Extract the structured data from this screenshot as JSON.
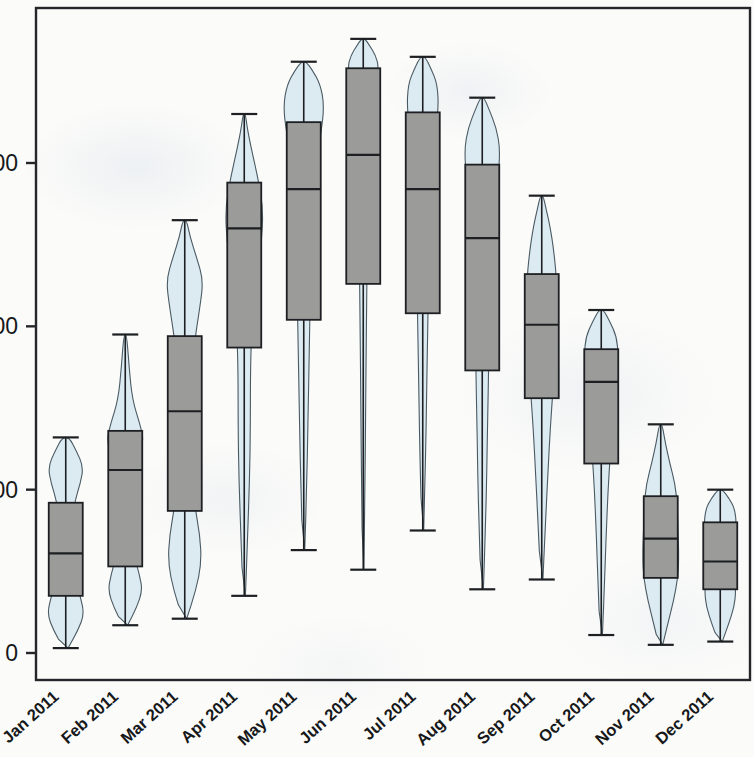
{
  "chart_data": {
    "type": "box",
    "title": "",
    "xlabel": "",
    "ylabel": "",
    "categories": [
      "Jan 2011",
      "Feb 2011",
      "Mar 2011",
      "Apr 2011",
      "May 2011",
      "Jun 2011",
      "Jul 2011",
      "Aug 2011",
      "Sep 2011",
      "Oct 2011",
      "Nov 2011",
      "Dec 2011"
    ],
    "ytick_labels": [
      "0",
      "100",
      "200",
      "300"
    ],
    "ytick_values": [
      0,
      100,
      200,
      300
    ],
    "ylim": [
      -8,
      413
    ],
    "xlim": [
      0,
      13
    ],
    "grid": false,
    "legend": false,
    "marks": "violin-plot with overlaid box-and-whisker (grey boxes, pale blue density curves)",
    "colors": {
      "violin_fill": "#dceaf1",
      "violin_stroke": "#4a5a63",
      "box_fill": "#9b9b99",
      "box_stroke": "#1d1f22",
      "axis": "#24262a",
      "background": "#fbfbf9"
    },
    "series": [
      {
        "name": "Jan 2011",
        "whisker_low": 3,
        "q1": 35,
        "median": 61,
        "q3": 92,
        "whisker_high": 132,
        "density": [
          {
            "v": 3,
            "w": 0.1
          },
          {
            "v": 14,
            "w": 0.52
          },
          {
            "v": 24,
            "w": 0.78
          },
          {
            "v": 35,
            "w": 0.6
          },
          {
            "v": 50,
            "w": 0.34
          },
          {
            "v": 62,
            "w": 0.26
          },
          {
            "v": 78,
            "w": 0.3
          },
          {
            "v": 92,
            "w": 0.36
          },
          {
            "v": 104,
            "w": 0.62
          },
          {
            "v": 114,
            "w": 0.74
          },
          {
            "v": 124,
            "w": 0.44
          },
          {
            "v": 132,
            "w": 0.14
          }
        ]
      },
      {
        "name": "Feb 2011",
        "whisker_low": 17,
        "q1": 53,
        "median": 112,
        "q3": 136,
        "whisker_high": 195,
        "density": [
          {
            "v": 17,
            "w": 0.1
          },
          {
            "v": 28,
            "w": 0.48
          },
          {
            "v": 38,
            "w": 0.72
          },
          {
            "v": 48,
            "w": 0.6
          },
          {
            "v": 60,
            "w": 0.36
          },
          {
            "v": 80,
            "w": 0.24
          },
          {
            "v": 100,
            "w": 0.26
          },
          {
            "v": 118,
            "w": 0.52
          },
          {
            "v": 130,
            "w": 0.78
          },
          {
            "v": 140,
            "w": 0.62
          },
          {
            "v": 155,
            "w": 0.3
          },
          {
            "v": 175,
            "w": 0.16
          },
          {
            "v": 195,
            "w": 0.06
          }
        ]
      },
      {
        "name": "Mar 2011",
        "whisker_low": 21,
        "q1": 87,
        "median": 148,
        "q3": 194,
        "whisker_high": 265,
        "density": [
          {
            "v": 21,
            "w": 0.08
          },
          {
            "v": 38,
            "w": 0.46
          },
          {
            "v": 55,
            "w": 0.7
          },
          {
            "v": 72,
            "w": 0.64
          },
          {
            "v": 92,
            "w": 0.4
          },
          {
            "v": 115,
            "w": 0.26
          },
          {
            "v": 140,
            "w": 0.22
          },
          {
            "v": 165,
            "w": 0.26
          },
          {
            "v": 188,
            "w": 0.38
          },
          {
            "v": 212,
            "w": 0.64
          },
          {
            "v": 228,
            "w": 0.78
          },
          {
            "v": 242,
            "w": 0.5
          },
          {
            "v": 255,
            "w": 0.22
          },
          {
            "v": 265,
            "w": 0.08
          }
        ]
      },
      {
        "name": "Apr 2011",
        "whisker_low": 35,
        "q1": 187,
        "median": 260,
        "q3": 288,
        "whisker_high": 330,
        "density": [
          {
            "v": 35,
            "w": 0.05
          },
          {
            "v": 70,
            "w": 0.14
          },
          {
            "v": 105,
            "w": 0.22
          },
          {
            "v": 140,
            "w": 0.26
          },
          {
            "v": 170,
            "w": 0.26
          },
          {
            "v": 195,
            "w": 0.3
          },
          {
            "v": 225,
            "w": 0.46
          },
          {
            "v": 250,
            "w": 0.72
          },
          {
            "v": 272,
            "w": 0.8
          },
          {
            "v": 292,
            "w": 0.56
          },
          {
            "v": 310,
            "w": 0.28
          },
          {
            "v": 322,
            "w": 0.12
          },
          {
            "v": 330,
            "w": 0.05
          }
        ]
      },
      {
        "name": "May 2011",
        "whisker_low": 63,
        "q1": 204,
        "median": 284,
        "q3": 325,
        "whisker_high": 362,
        "density": [
          {
            "v": 63,
            "w": 0.04
          },
          {
            "v": 100,
            "w": 0.12
          },
          {
            "v": 140,
            "w": 0.18
          },
          {
            "v": 178,
            "w": 0.22
          },
          {
            "v": 208,
            "w": 0.26
          },
          {
            "v": 240,
            "w": 0.3
          },
          {
            "v": 268,
            "w": 0.34
          },
          {
            "v": 295,
            "w": 0.44
          },
          {
            "v": 318,
            "w": 0.72
          },
          {
            "v": 335,
            "w": 0.86
          },
          {
            "v": 348,
            "w": 0.7
          },
          {
            "v": 357,
            "w": 0.36
          },
          {
            "v": 362,
            "w": 0.1
          }
        ]
      },
      {
        "name": "Jun 2011",
        "whisker_low": 51,
        "q1": 226,
        "median": 305,
        "q3": 358,
        "whisker_high": 376,
        "density": [
          {
            "v": 51,
            "w": 0.03
          },
          {
            "v": 100,
            "w": 0.07
          },
          {
            "v": 150,
            "w": 0.1
          },
          {
            "v": 200,
            "w": 0.13
          },
          {
            "v": 245,
            "w": 0.17
          },
          {
            "v": 285,
            "w": 0.2
          },
          {
            "v": 320,
            "w": 0.24
          },
          {
            "v": 345,
            "w": 0.42
          },
          {
            "v": 358,
            "w": 0.66
          },
          {
            "v": 366,
            "w": 0.52
          },
          {
            "v": 372,
            "w": 0.26
          },
          {
            "v": 376,
            "w": 0.08
          }
        ]
      },
      {
        "name": "Jul 2011",
        "whisker_low": 75,
        "q1": 208,
        "median": 284,
        "q3": 331,
        "whisker_high": 365,
        "density": [
          {
            "v": 75,
            "w": 0.04
          },
          {
            "v": 115,
            "w": 0.11
          },
          {
            "v": 155,
            "w": 0.16
          },
          {
            "v": 190,
            "w": 0.2
          },
          {
            "v": 220,
            "w": 0.23
          },
          {
            "v": 252,
            "w": 0.26
          },
          {
            "v": 282,
            "w": 0.3
          },
          {
            "v": 310,
            "w": 0.42
          },
          {
            "v": 332,
            "w": 0.66
          },
          {
            "v": 348,
            "w": 0.62
          },
          {
            "v": 358,
            "w": 0.34
          },
          {
            "v": 365,
            "w": 0.1
          }
        ]
      },
      {
        "name": "Aug 2011",
        "whisker_low": 39,
        "q1": 173,
        "median": 254,
        "q3": 299,
        "whisker_high": 340,
        "density": [
          {
            "v": 39,
            "w": 0.05
          },
          {
            "v": 75,
            "w": 0.13
          },
          {
            "v": 110,
            "w": 0.19
          },
          {
            "v": 145,
            "w": 0.23
          },
          {
            "v": 175,
            "w": 0.27
          },
          {
            "v": 205,
            "w": 0.3
          },
          {
            "v": 235,
            "w": 0.34
          },
          {
            "v": 262,
            "w": 0.42
          },
          {
            "v": 288,
            "w": 0.64
          },
          {
            "v": 308,
            "w": 0.76
          },
          {
            "v": 322,
            "w": 0.58
          },
          {
            "v": 333,
            "w": 0.28
          },
          {
            "v": 340,
            "w": 0.08
          }
        ]
      },
      {
        "name": "Sep 2011",
        "whisker_low": 45,
        "q1": 156,
        "median": 201,
        "q3": 232,
        "whisker_high": 280,
        "density": [
          {
            "v": 45,
            "w": 0.05
          },
          {
            "v": 80,
            "w": 0.16
          },
          {
            "v": 110,
            "w": 0.26
          },
          {
            "v": 138,
            "w": 0.36
          },
          {
            "v": 162,
            "w": 0.48
          },
          {
            "v": 185,
            "w": 0.56
          },
          {
            "v": 205,
            "w": 0.62
          },
          {
            "v": 225,
            "w": 0.64
          },
          {
            "v": 245,
            "w": 0.52
          },
          {
            "v": 262,
            "w": 0.34
          },
          {
            "v": 272,
            "w": 0.18
          },
          {
            "v": 280,
            "w": 0.06
          }
        ]
      },
      {
        "name": "Oct 2011",
        "whisker_low": 11,
        "q1": 116,
        "median": 166,
        "q3": 186,
        "whisker_high": 210,
        "density": [
          {
            "v": 11,
            "w": 0.05
          },
          {
            "v": 40,
            "w": 0.13
          },
          {
            "v": 70,
            "w": 0.2
          },
          {
            "v": 98,
            "w": 0.28
          },
          {
            "v": 122,
            "w": 0.38
          },
          {
            "v": 145,
            "w": 0.5
          },
          {
            "v": 166,
            "w": 0.62
          },
          {
            "v": 182,
            "w": 0.72
          },
          {
            "v": 194,
            "w": 0.64
          },
          {
            "v": 203,
            "w": 0.36
          },
          {
            "v": 210,
            "w": 0.1
          }
        ]
      },
      {
        "name": "Nov 2011",
        "whisker_low": 5,
        "q1": 46,
        "median": 70,
        "q3": 96,
        "whisker_high": 140,
        "density": [
          {
            "v": 5,
            "w": 0.08
          },
          {
            "v": 18,
            "w": 0.3
          },
          {
            "v": 32,
            "w": 0.54
          },
          {
            "v": 46,
            "w": 0.72
          },
          {
            "v": 60,
            "w": 0.76
          },
          {
            "v": 75,
            "w": 0.72
          },
          {
            "v": 90,
            "w": 0.7
          },
          {
            "v": 104,
            "w": 0.6
          },
          {
            "v": 116,
            "w": 0.38
          },
          {
            "v": 128,
            "w": 0.2
          },
          {
            "v": 140,
            "w": 0.06
          }
        ]
      },
      {
        "name": "Dec 2011",
        "whisker_low": 7,
        "q1": 39,
        "median": 56,
        "q3": 80,
        "whisker_high": 100,
        "density": [
          {
            "v": 7,
            "w": 0.08
          },
          {
            "v": 18,
            "w": 0.36
          },
          {
            "v": 28,
            "w": 0.58
          },
          {
            "v": 38,
            "w": 0.66
          },
          {
            "v": 48,
            "w": 0.56
          },
          {
            "v": 58,
            "w": 0.5
          },
          {
            "v": 68,
            "w": 0.54
          },
          {
            "v": 78,
            "w": 0.68
          },
          {
            "v": 88,
            "w": 0.62
          },
          {
            "v": 95,
            "w": 0.36
          },
          {
            "v": 100,
            "w": 0.1
          }
        ]
      }
    ]
  }
}
